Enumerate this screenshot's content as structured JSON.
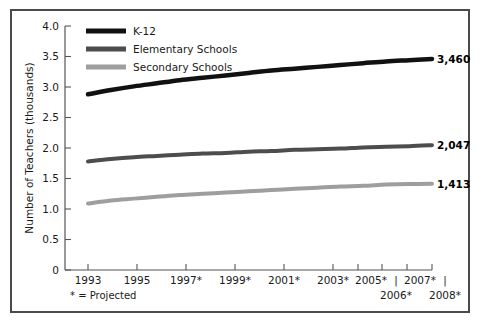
{
  "figure": {
    "frame_color": "#4a4a4a",
    "background": "#ffffff"
  },
  "axes": {
    "y_title": "Number of Teachers (thousands)",
    "y_ticks": [
      "4.0",
      "3.5",
      "3.0",
      "2.5",
      "2.0",
      "1.5",
      "1.0",
      "0.5",
      "0"
    ],
    "x_ticks_row1": [
      "1993",
      "1995",
      "1997*",
      "1999*",
      "2001*",
      "2003*",
      "2005*",
      "2007*"
    ],
    "x_ticks_row2": [
      "2006*",
      "2008*"
    ],
    "x_connector": "|"
  },
  "footnote": {
    "text": "* = Projected"
  },
  "legend": [
    {
      "label": "K-12",
      "color": "#111111"
    },
    {
      "label": "Elementary Schools",
      "color": "#4d4d4d"
    },
    {
      "label": "Secondary Schools",
      "color": "#9e9e9e"
    }
  ],
  "end_labels": [
    {
      "value": "3,460",
      "series": "K-12"
    },
    {
      "value": "2,047",
      "series": "Elementary Schools"
    },
    {
      "value": "1,413",
      "series": "Secondary Schools"
    }
  ],
  "chart_data": {
    "type": "line",
    "title": "",
    "xlabel": "",
    "ylabel": "Number of Teachers (thousands)",
    "ylim": [
      0,
      4.0
    ],
    "ytick_values": [
      4.0,
      3.5,
      3.0,
      2.5,
      2.0,
      1.5,
      1.0,
      0.5,
      0
    ],
    "grid": false,
    "legend_position": "top-left",
    "x": [
      1993,
      1994,
      1995,
      1996,
      1997,
      1998,
      1999,
      2000,
      2001,
      2002,
      2003,
      2004,
      2005,
      2006,
      2007,
      2008
    ],
    "xtick_labels": [
      "1993",
      "1995",
      "1997*",
      "1999*",
      "2001*",
      "2003*",
      "2005*",
      "2006*",
      "2007*",
      "2008*"
    ],
    "projected_from": 1997,
    "units": "thousands of teachers",
    "series": [
      {
        "name": "K-12",
        "color": "#111111",
        "values": [
          2.88,
          2.95,
          3.01,
          3.06,
          3.11,
          3.15,
          3.19,
          3.23,
          3.27,
          3.3,
          3.33,
          3.36,
          3.39,
          3.42,
          3.44,
          3.46
        ],
        "end_value": 3.46,
        "end_label": "3,460"
      },
      {
        "name": "Elementary Schools",
        "color": "#4d4d4d",
        "values": [
          1.78,
          1.82,
          1.85,
          1.87,
          1.89,
          1.91,
          1.92,
          1.94,
          1.95,
          1.97,
          1.98,
          1.99,
          2.01,
          2.02,
          2.03,
          2.047
        ],
        "end_value": 2.047,
        "end_label": "2,047"
      },
      {
        "name": "Secondary Schools",
        "color": "#9e9e9e",
        "values": [
          1.09,
          1.14,
          1.17,
          1.2,
          1.23,
          1.25,
          1.27,
          1.29,
          1.31,
          1.33,
          1.35,
          1.37,
          1.38,
          1.4,
          1.41,
          1.413
        ],
        "end_value": 1.413,
        "end_label": "1,413"
      }
    ]
  }
}
